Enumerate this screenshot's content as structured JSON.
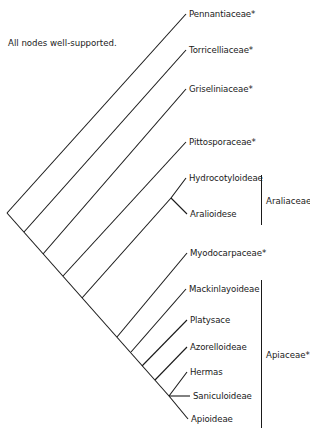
{
  "note": "All nodes well-supported.",
  "line_color": "#1a1a1a",
  "taxa": [
    {
      "id": "pennantiaceae",
      "label": "Pennantiaceae*",
      "tip": [
        186,
        14
      ],
      "node": [
        7,
        213
      ]
    },
    {
      "id": "torricelliaceae",
      "label": "Torricelliaceae*",
      "tip": [
        186,
        50
      ],
      "node": [
        24,
        232
      ]
    },
    {
      "id": "griseliniaceae",
      "label": "Griseliniaceae*",
      "tip": [
        186,
        89
      ],
      "node": [
        43,
        254
      ]
    },
    {
      "id": "pittosporaceae",
      "label": "Pittosporaceae*",
      "tip": [
        186,
        142
      ],
      "node": [
        63,
        276
      ]
    },
    {
      "id": "hydrocotyloideae",
      "label": "Hydrocotyloideae",
      "tip": [
        186,
        178
      ],
      "node": [
        171,
        198
      ]
    },
    {
      "id": "aralioidese",
      "label": "Aralioidese",
      "tip": [
        187,
        214
      ],
      "node": [
        171,
        198
      ]
    },
    {
      "id": "myodocarpaceae",
      "label": "Myodocarpaceae*",
      "tip": [
        187,
        253
      ],
      "node": [
        117,
        337
      ]
    },
    {
      "id": "mackinlayoideae",
      "label": "Mackinlayoideae",
      "tip": [
        186,
        289
      ],
      "node": [
        131,
        352
      ]
    },
    {
      "id": "platysace",
      "label": "Platysace",
      "tip": [
        187,
        320
      ],
      "node": [
        142,
        366
      ]
    },
    {
      "id": "azorelloideae",
      "label": "Azorelloideae",
      "tip": [
        187,
        347
      ],
      "node": [
        155,
        380
      ]
    },
    {
      "id": "hermas",
      "label": "Hermas",
      "tip": [
        187,
        372
      ],
      "node": [
        169,
        396
      ]
    },
    {
      "id": "saniculoideae",
      "label": "Saniculoideae",
      "tip": [
        190,
        396
      ],
      "node": [
        169,
        396
      ]
    },
    {
      "id": "apioideae",
      "label": "Apioideae",
      "tip": [
        188,
        419
      ],
      "node": [
        169,
        396
      ]
    }
  ],
  "internal_edges": [
    {
      "from": [
        7,
        213
      ],
      "to": [
        169,
        396
      ],
      "name": "spine"
    },
    {
      "from": [
        82,
        298
      ],
      "to": [
        171,
        198
      ],
      "name": "araliaceae-stem"
    }
  ],
  "clades": [
    {
      "id": "araliaceae",
      "label": "Araliaceae*",
      "bar_x": 261,
      "y_top": 175,
      "y_bottom": 225,
      "label_y": 196
    },
    {
      "id": "apiaceae",
      "label": "Apiaceae*",
      "bar_x": 261,
      "y_top": 280,
      "y_bottom": 428,
      "label_y": 350
    }
  ]
}
